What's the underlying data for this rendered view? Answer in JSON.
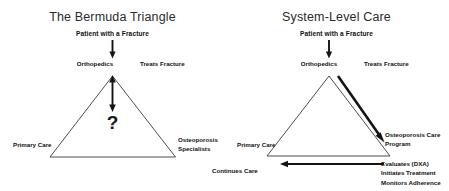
{
  "panels": [
    {
      "id": "bermuda-triangle",
      "title": "The Bermuda Triangle",
      "labels": {
        "patient": "Patient with a Fracture",
        "orthopedics": "Orthopedics",
        "treats_fracture": "Treats Fracture",
        "primary_care": "Primary Care",
        "osteoporosis_specialists_line1": "Osteoporosis",
        "osteoporosis_specialists_line2": "Specialists",
        "question_mark": "?"
      }
    },
    {
      "id": "system-level-care",
      "title": "System-Level Care",
      "labels": {
        "patient": "Patient with a Fracture",
        "orthopedics": "Orthopedics",
        "treats_fracture": "Treats Fracture",
        "primary_care": "Primary Care",
        "osteoporosis_care_program_line1": "Osteoporosis Care",
        "osteoporosis_care_program_line2": "Program",
        "continues_care": "Continues  Care",
        "action_line1": "Evaluates (DXA)",
        "action_line2": "Initiates Treatment",
        "action_line3": "Monitors Adherence"
      }
    }
  ],
  "colors": {
    "background": "#ffffff",
    "triangle_stroke": "#3a3a3a",
    "arrow": "#141414",
    "text": "#111111",
    "title_text": "#2b2b2b"
  }
}
